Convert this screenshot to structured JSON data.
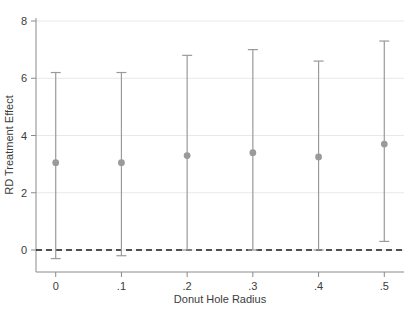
{
  "chart_data": {
    "type": "scatter",
    "title": "",
    "subtitle": "",
    "xlabel": "Donut Hole Radius",
    "ylabel": "RD Treatment Effect",
    "x": [
      0,
      0.1,
      0.2,
      0.3,
      0.4,
      0.5
    ],
    "xtick_labels": [
      "0",
      ".1",
      ".2",
      ".3",
      ".4",
      ".5"
    ],
    "ytick_labels": [
      "0",
      "2",
      "4",
      "6",
      "8"
    ],
    "ytick_values": [
      0,
      2,
      4,
      6,
      8
    ],
    "xlim": [
      -0.03,
      0.53
    ],
    "ylim": [
      -0.7,
      8.3
    ],
    "grid": "horizontal",
    "legend": "none",
    "series": [
      {
        "name": "RD Treatment Effect",
        "values": [
          3.05,
          3.05,
          3.3,
          3.4,
          3.25,
          3.7
        ],
        "ci_lower": [
          -0.3,
          -0.2,
          0.0,
          0.0,
          0.0,
          0.3
        ],
        "ci_upper": [
          6.2,
          6.2,
          6.8,
          7.0,
          6.6,
          7.3
        ],
        "marker_color": "#9a9a9a",
        "line_color": "#9a9a9a"
      }
    ],
    "reference_lines": [
      {
        "axis": "y",
        "value": 0,
        "style": "dashed",
        "color": "#1a1a1a"
      }
    ],
    "axis_color": "#8a8a8a",
    "grid_color": "#e8e8e8",
    "background_color": "#ffffff"
  }
}
